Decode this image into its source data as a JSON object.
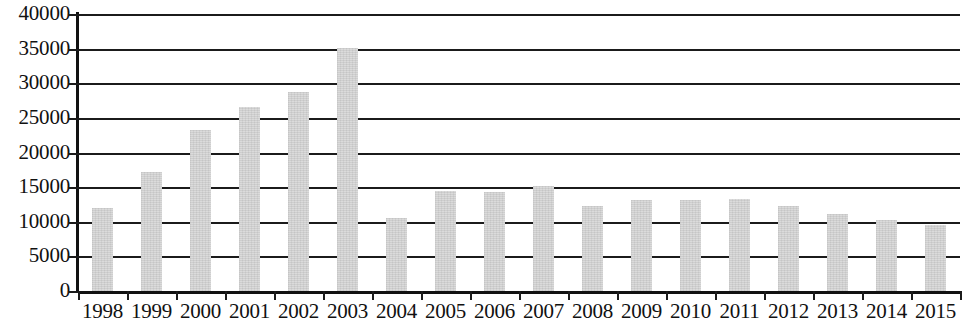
{
  "chart_data": {
    "type": "bar",
    "title": "",
    "subtitle": "",
    "xlabel": "",
    "ylabel": "",
    "ylim": [
      0,
      40000
    ],
    "ytick_step": 5000,
    "grid": true,
    "legend": false,
    "bar_color": "#d4d4d4",
    "axis_color": "#111111",
    "categories": [
      "1998",
      "1999",
      "2000",
      "2001",
      "2002",
      "2003",
      "2004",
      "2005",
      "2006",
      "2007",
      "2008",
      "2009",
      "2010",
      "2011",
      "2012",
      "2013",
      "2014",
      "2015"
    ],
    "values": [
      12000,
      17200,
      23300,
      26600,
      28700,
      35100,
      10600,
      14500,
      14300,
      15200,
      12300,
      13100,
      13200,
      13300,
      12300,
      11100,
      10300,
      9600
    ],
    "ytick_labels": [
      "40000",
      "35000",
      "30000",
      "25000",
      "20000",
      "15000",
      "10000",
      "5000",
      "0"
    ]
  }
}
